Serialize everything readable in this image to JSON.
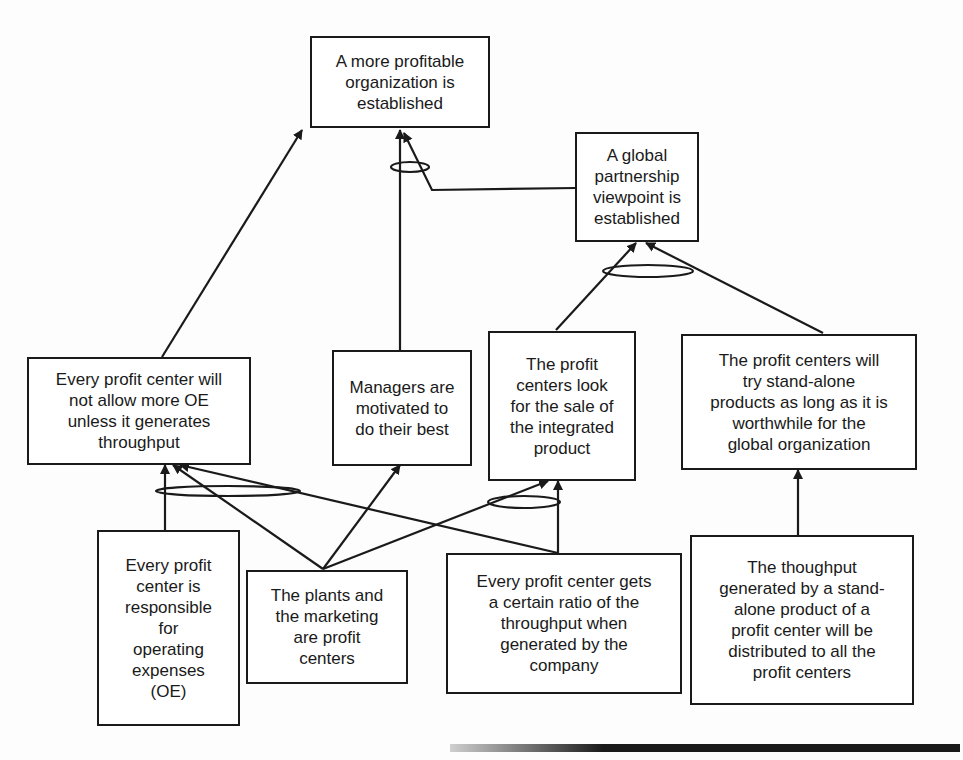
{
  "diagram": {
    "type": "current-reality / future-reality tree",
    "nodes": {
      "profitable_org": {
        "text": "A more profitable\norganization is\nestablished"
      },
      "global_partnership": {
        "text": "A global\npartnership\nviewpoint is\nestablished"
      },
      "no_more_oe": {
        "text": "Every profit center will\nnot allow more OE\nunless it generates\nthroughput"
      },
      "managers_motivated": {
        "text": "Managers are\nmotivated to\ndo their best"
      },
      "integrated_product": {
        "text": "The profit\ncenters look\nfor the sale of\nthe integrated\nproduct"
      },
      "stand_alone": {
        "text": "The profit centers will\ntry stand-alone\nproducts as long as it is\nworthwhile for the\nglobal organization"
      },
      "responsible_oe": {
        "text": "Every profit\ncenter is\nresponsible\nfor\noperating\nexpenses\n(OE)"
      },
      "plants_marketing": {
        "text": "The plants and\nthe marketing\nare profit\ncenters"
      },
      "ratio_throughput": {
        "text": "Every profit center gets\na certain ratio of the\nthroughput when\ngenerated by the\ncompany"
      },
      "distributed_throughput": {
        "text": "The thoughput\ngenerated by a stand-\nalone product of a\nprofit center will be\ndistributed to all the\nprofit centers"
      }
    },
    "edges": [
      {
        "from": "no_more_oe",
        "to": "profitable_org"
      },
      {
        "from": "managers_motivated",
        "to": "profitable_org",
        "and_group": 1
      },
      {
        "from": "global_partnership",
        "to": "profitable_org",
        "and_group": 1
      },
      {
        "from": "integrated_product",
        "to": "global_partnership",
        "and_group": 2
      },
      {
        "from": "stand_alone",
        "to": "global_partnership",
        "and_group": 2
      },
      {
        "from": "responsible_oe",
        "to": "no_more_oe",
        "and_group": 3
      },
      {
        "from": "plants_marketing",
        "to": "no_more_oe",
        "and_group": 3
      },
      {
        "from": "ratio_throughput",
        "to": "no_more_oe",
        "and_group": 3
      },
      {
        "from": "plants_marketing",
        "to": "managers_motivated"
      },
      {
        "from": "plants_marketing",
        "to": "integrated_product",
        "and_group": 4
      },
      {
        "from": "ratio_throughput",
        "to": "integrated_product",
        "and_group": 4
      },
      {
        "from": "distributed_throughput",
        "to": "stand_alone"
      }
    ],
    "colors": {
      "line": "#1a1a1a",
      "box_fill": "#ffffff",
      "background": "#fdfdfd"
    }
  }
}
